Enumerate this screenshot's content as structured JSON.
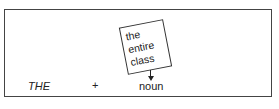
{
  "diagram": {
    "sequence": [
      {
        "label": "THE",
        "style": "italic"
      },
      {
        "label": "+"
      },
      {
        "label": "noun"
      }
    ],
    "annotation": {
      "lines": [
        "the",
        "entire",
        "class"
      ],
      "points_to": "noun"
    }
  }
}
